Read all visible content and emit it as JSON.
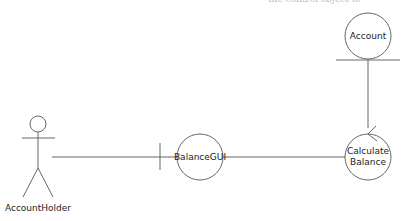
{
  "diagram": {
    "type": "robustness-diagram",
    "actor": {
      "label": "AccountHolder"
    },
    "boundary": {
      "label": "BalanceGUI"
    },
    "control": {
      "label_line1": "Calculate",
      "label_line2": "Balance"
    },
    "entity": {
      "label": "Account"
    },
    "stroke_color": "#555555",
    "top_cut_text": "the control object to"
  }
}
